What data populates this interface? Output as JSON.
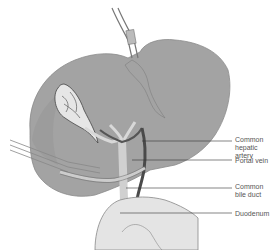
{
  "diagram": {
    "colors": {
      "liver": "#a3a3a3",
      "liver_outline": "#8a8a8a",
      "gallbladder": "#e6e6e6",
      "vessel_dark": "#555555",
      "duct_light": "#d8d8d8",
      "duodenum": "#e4e4e4",
      "leader_line": "#333333",
      "label_text": "#555555"
    },
    "labels": [
      {
        "id": "common-hepatic-artery",
        "text": "Common\nhepatic artery"
      },
      {
        "id": "portal-vein",
        "text": "Portal vein"
      },
      {
        "id": "common-bile-duct",
        "text": "Common\nbile duct"
      },
      {
        "id": "duodenum",
        "text": "Duodenum"
      }
    ]
  }
}
